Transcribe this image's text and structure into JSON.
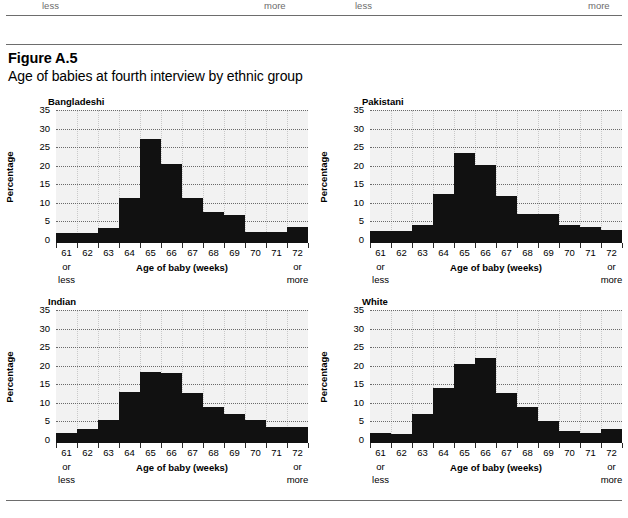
{
  "top_strip": {
    "labels": [
      {
        "text": "less",
        "x": 42
      },
      {
        "text": "more",
        "x": 264
      },
      {
        "text": "less",
        "x": 355
      },
      {
        "text": "more",
        "x": 588
      }
    ]
  },
  "figure": {
    "number": "Figure A.5",
    "title": "Age of babies at fourth interview by ethnic group"
  },
  "axis": {
    "ylabel": "Percentage",
    "xlabel": "Age of baby (weeks)",
    "yticks": [
      "0",
      "5",
      "10",
      "15",
      "20",
      "25",
      "30",
      "35"
    ],
    "xticks": [
      "61",
      "62",
      "63",
      "64",
      "65",
      "66",
      "67",
      "68",
      "69",
      "70",
      "71",
      "72"
    ],
    "x_first_suffix": [
      "or",
      "less"
    ],
    "x_last_suffix": [
      "or",
      "more"
    ]
  },
  "colors": {
    "bar": "#111111",
    "plot_background": "#f2f2f2",
    "gridline": "#6a6a6a",
    "rule": "#6d6d6d",
    "bleed_text": "#6b6b6b"
  },
  "chart_data": [
    {
      "type": "bar",
      "title": "Bangladeshi",
      "xlabel": "Age of baby (weeks)",
      "ylabel": "Percentage",
      "ylim": [
        0,
        35
      ],
      "ytick_step": 5,
      "grid": true,
      "legend": "none",
      "categories": [
        "61 or less",
        "62",
        "63",
        "64",
        "65",
        "66",
        "67",
        "68",
        "69",
        "70",
        "71",
        "72 or more"
      ],
      "values": [
        1.8,
        1.8,
        3.3,
        11.4,
        27.2,
        20.4,
        11.3,
        7.6,
        6.8,
        2.1,
        2.1,
        3.5
      ]
    },
    {
      "type": "bar",
      "title": "Pakistani",
      "xlabel": "Age of baby (weeks)",
      "ylabel": "Percentage",
      "ylim": [
        0,
        35
      ],
      "ytick_step": 5,
      "grid": true,
      "legend": "none",
      "categories": [
        "61 or less",
        "62",
        "63",
        "64",
        "65",
        "66",
        "67",
        "68",
        "69",
        "70",
        "71",
        "72 or more"
      ],
      "values": [
        2.4,
        2.4,
        4.0,
        12.4,
        23.5,
        20.2,
        11.8,
        6.9,
        6.9,
        4.0,
        3.4,
        2.7
      ]
    },
    {
      "type": "bar",
      "title": "Indian",
      "xlabel": "Age of baby (weeks)",
      "ylabel": "Percentage",
      "ylim": [
        0,
        35
      ],
      "ytick_step": 5,
      "grid": true,
      "legend": "none",
      "categories": [
        "61 or less",
        "62",
        "63",
        "64",
        "65",
        "66",
        "67",
        "68",
        "69",
        "70",
        "71",
        "72 or more"
      ],
      "values": [
        1.9,
        3.0,
        5.5,
        12.8,
        18.3,
        18.0,
        12.7,
        9.0,
        7.0,
        5.3,
        3.5,
        3.5
      ]
    },
    {
      "type": "bar",
      "title": "White",
      "xlabel": "Age of baby (weeks)",
      "ylabel": "Percentage",
      "ylim": [
        0,
        35
      ],
      "ytick_step": 5,
      "grid": true,
      "legend": "none",
      "categories": [
        "61 or less",
        "62",
        "63",
        "64",
        "65",
        "66",
        "67",
        "68",
        "69",
        "70",
        "71",
        "72 or more"
      ],
      "values": [
        2.0,
        1.7,
        7.0,
        14.0,
        20.5,
        22.0,
        12.7,
        9.0,
        5.0,
        2.5,
        2.0,
        3.0
      ]
    }
  ]
}
